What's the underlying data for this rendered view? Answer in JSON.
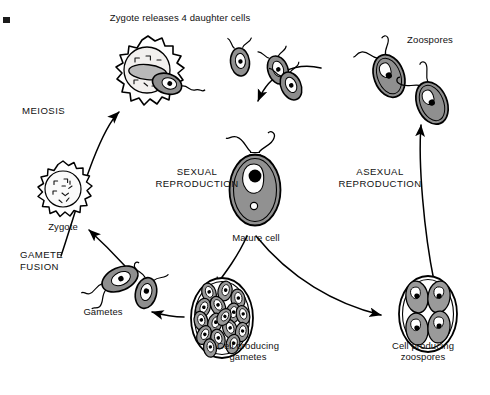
{
  "figure": {
    "title_caption": "Zygote releases 4 daughter cells",
    "type": "life-cycle-diagram",
    "organism_implied": "Chlamydomonas",
    "background_color": "#ffffff",
    "line_color": "#000000",
    "cell_fill_color": "#9b9b9b",
    "cell_highlight_color": "#e8e8e8",
    "nucleus_color": "#000000"
  },
  "labels": {
    "top_caption": "Zygote releases 4 daughter cells",
    "zoospores": "Zoospores",
    "meiosis": "MEIOSIS",
    "sexual_reproduction": "SEXUAL\nREPRODUCTION",
    "asexual_reproduction": "ASEXUAL\nREPRODUCTION",
    "mature_cell": "Mature cell",
    "zygote": "Zygote",
    "gamete_fusion": "GAMETE\nFUSION",
    "gametes": "Gametes",
    "cell_producing_gametes": "Cell producing\ngametes",
    "cell_producing_zoospores": "Cell producing\nzoospores"
  },
  "stages": [
    {
      "id": "zygote-releasing",
      "label": "Zygote releases 4 daughter cells",
      "x": 148,
      "y": 72,
      "kind": "spiky-zygote-releasing-cell"
    },
    {
      "id": "daughter-cells",
      "label": "daughter cells",
      "x": 240,
      "y": 70,
      "kind": "flagellated-cells",
      "count": 3
    },
    {
      "id": "zoospores",
      "label": "Zoospores",
      "x": 400,
      "y": 78,
      "kind": "flagellated-cells",
      "count": 2
    },
    {
      "id": "mature-cell",
      "label": "Mature cell",
      "x": 255,
      "y": 190,
      "kind": "mature-flagellated-cell"
    },
    {
      "id": "zygote",
      "label": "Zygote",
      "x": 63,
      "y": 190,
      "kind": "spiky-zygote"
    },
    {
      "id": "gametes",
      "label": "Gametes",
      "x": 130,
      "y": 288,
      "kind": "fusing-gametes",
      "count": 2
    },
    {
      "id": "cell-producing-gametes",
      "label": "Cell producing gametes",
      "x": 222,
      "y": 318,
      "kind": "sporangium",
      "inner_count": 16
    },
    {
      "id": "cell-producing-zoospores",
      "label": "Cell producing zoospores",
      "x": 428,
      "y": 314,
      "kind": "sporangium",
      "inner_count": 4
    }
  ],
  "arrows": [
    {
      "id": "arrow-zygote-to-release",
      "from": "zygote",
      "to": "zygote-releasing",
      "label": "MEIOSIS"
    },
    {
      "id": "arrow-daughters-to-mature",
      "from": "daughter-cells",
      "to": "mature-cell",
      "label": ""
    },
    {
      "id": "arrow-mature-to-gametes-cell",
      "from": "mature-cell",
      "to": "cell-producing-gametes",
      "label": ""
    },
    {
      "id": "arrow-mature-to-zoospore-cell",
      "from": "mature-cell",
      "to": "cell-producing-zoospores",
      "label": ""
    },
    {
      "id": "arrow-gametes-cell-to-gametes",
      "from": "cell-producing-gametes",
      "to": "gametes",
      "label": ""
    },
    {
      "id": "arrow-gametes-to-zygote",
      "from": "gametes",
      "to": "zygote",
      "label": "GAMETE FUSION"
    },
    {
      "id": "arrow-zoospore-cell-to-zoospores",
      "from": "cell-producing-zoospores",
      "to": "zoospores",
      "label": ""
    }
  ],
  "marks": {
    "corner_mark": "■"
  }
}
